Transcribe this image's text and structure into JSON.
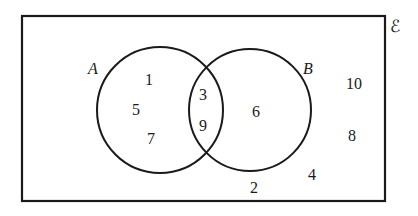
{
  "diagram": {
    "type": "venn",
    "universal_symbol": "ℰ",
    "sets": [
      {
        "name": "A",
        "label": "A"
      },
      {
        "name": "B",
        "label": "B"
      }
    ],
    "regions": {
      "a_only": [
        "1",
        "5",
        "7"
      ],
      "a_and_b": [
        "3",
        "9"
      ],
      "b_only": [
        "6"
      ],
      "outside": [
        "10",
        "8",
        "4",
        "2"
      ]
    }
  },
  "colors": {
    "stroke": "#1a1a1a",
    "background": "#ffffff"
  }
}
